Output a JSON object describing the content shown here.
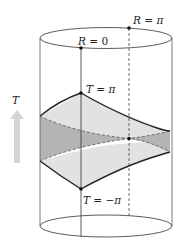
{
  "diagram": {
    "type": "AdS cylinder with causal diamond (Wheeler–DeWitt patch)",
    "axis_label": "T",
    "labels": {
      "r_zero": "R = 0",
      "r_pi": "R = π",
      "t_pi": "T = π",
      "t_minus_pi": "T = −π"
    },
    "label_parts": {
      "r_zero": {
        "var": "R",
        "eq": " = ",
        "val": "0"
      },
      "r_pi": {
        "var": "R",
        "eq": " = ",
        "val": "π"
      },
      "t_pi": {
        "var": "T",
        "eq": " = ",
        "val": "π"
      },
      "t_minus_pi": {
        "var": "T",
        "eq": " = ",
        "val": "−π"
      }
    },
    "colors": {
      "outline": "#333333",
      "light_fill": "#e2e2e2",
      "dark_fill": "#b4b4b4",
      "arrow": "#d4d4d4"
    }
  }
}
